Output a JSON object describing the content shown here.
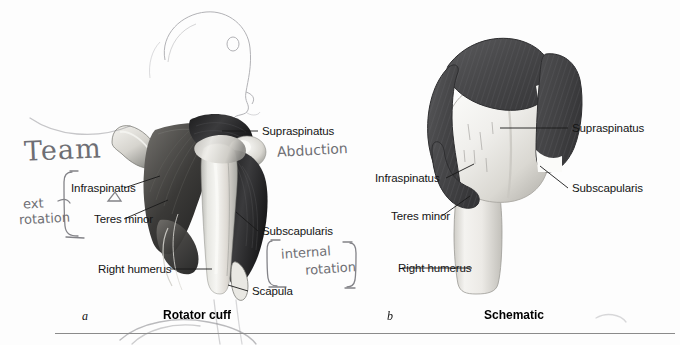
{
  "figure": {
    "background_color": "#fdfdfd",
    "muscle_color": "#4a4a4c",
    "bone_color": "#efefec",
    "label_color": "#141414"
  },
  "panel_a": {
    "letter": "a",
    "title": "Rotator cuff",
    "labels": [
      {
        "name": "supraspinatus",
        "text": "Supraspinatus"
      },
      {
        "name": "infraspinatus",
        "text": "Infraspinatus"
      },
      {
        "name": "teres-minor",
        "text": "Teres minor"
      },
      {
        "name": "subscapularis",
        "text": "Subscapularis"
      },
      {
        "name": "right-humerus",
        "text": "Right humerus"
      },
      {
        "name": "scapula",
        "text": "Scapula"
      }
    ]
  },
  "panel_b": {
    "letter": "b",
    "title": "Schematic",
    "labels": [
      {
        "name": "supraspinatus",
        "text": "Supraspinatus"
      },
      {
        "name": "infraspinatus",
        "text": "Infraspinatus"
      },
      {
        "name": "teres-minor",
        "text": "Teres minor"
      },
      {
        "name": "subscapularis",
        "text": "Subscapularis"
      },
      {
        "name": "right-humerus",
        "text": "Right humerus"
      }
    ]
  },
  "annotations": {
    "team": "Team",
    "ext_rotation_line1": "ext",
    "ext_rotation_line2": "rotation",
    "abduction": "Abduction",
    "internal_rotation_line1": "internal",
    "internal_rotation_line2": "rotation"
  }
}
